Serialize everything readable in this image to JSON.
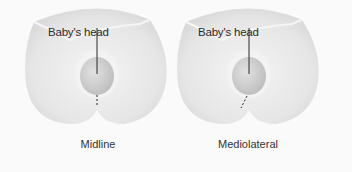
{
  "figure": {
    "panels": [
      {
        "id": "midline",
        "annotation": "Baby's head",
        "caption": "Midline",
        "incision": "vertical-midline"
      },
      {
        "id": "mediolateral",
        "annotation": "Baby's head",
        "caption": "Mediolateral",
        "incision": "angled-lateral"
      }
    ],
    "colors": {
      "background": "#fafafa",
      "body": "#e8e8e8",
      "head": "#cfcfcf",
      "line": "#2a2a2a"
    }
  }
}
